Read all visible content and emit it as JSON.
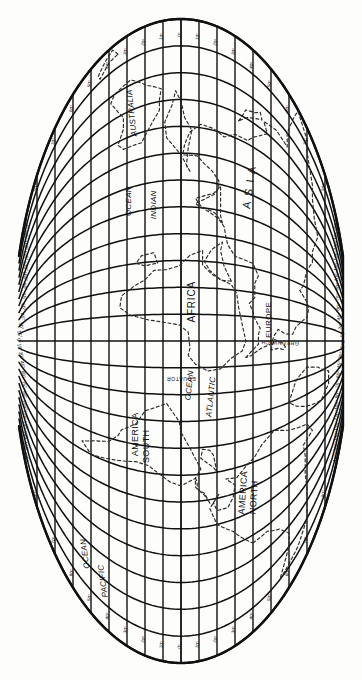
{
  "document": {
    "title": "World Map — Oval (Mollweide-type) Projection, rotated 90°",
    "orientation": "rotated-90-clockwise",
    "line_color": "#101010",
    "coast_color": "#2a2a2a",
    "background": "#fdfdfc"
  },
  "map": {
    "projection": "oval / elliptical (Mollweide-like)",
    "graticule": {
      "meridian_interval_deg": 15,
      "parallel_interval_deg": 10,
      "meridian_count": 17,
      "parallel_count": 17,
      "central_meridian_label": "GREENWICH",
      "equator_label": "EQUATOR"
    },
    "labels": [
      {
        "name": "asia-label",
        "text": "A S I A",
        "region": "continent"
      },
      {
        "name": "europe-label",
        "text": "EUROPE",
        "region": "continent"
      },
      {
        "name": "africa-label",
        "text": "AFRICA",
        "region": "continent"
      },
      {
        "name": "australia-label",
        "text": "AUSTRALIA",
        "region": "continent"
      },
      {
        "name": "north-america-label-1",
        "text": "NORTH",
        "region": "continent"
      },
      {
        "name": "north-america-label-2",
        "text": "AMERICA",
        "region": "continent"
      },
      {
        "name": "south-america-label-1",
        "text": "SOUTH",
        "region": "continent"
      },
      {
        "name": "south-america-label-2",
        "text": "AMERICA",
        "region": "continent"
      },
      {
        "name": "indian-ocean-label-1",
        "text": "INDIAN",
        "region": "ocean"
      },
      {
        "name": "indian-ocean-label-2",
        "text": "OCEAN",
        "region": "ocean"
      },
      {
        "name": "atlantic-ocean-label-1",
        "text": "ATLANTIC",
        "region": "ocean"
      },
      {
        "name": "atlantic-ocean-label-2",
        "text": "OCEAN",
        "region": "ocean"
      },
      {
        "name": "pacific-ocean-label-1",
        "text": "PACIFIC",
        "region": "ocean"
      },
      {
        "name": "pacific-ocean-label-2",
        "text": "OCEAN",
        "region": "ocean"
      },
      {
        "name": "greenwich-label",
        "text": "GREENWICH",
        "region": "meridian"
      },
      {
        "name": "equator-label",
        "text": "EQUATOR",
        "region": "parallel"
      }
    ],
    "degree_ticks": {
      "longitude_top": [
        "15°",
        "30°",
        "45°",
        "60°",
        "75°",
        "90°",
        "105°",
        "120°"
      ],
      "longitude_bottom": [
        "15°",
        "30°",
        "45°",
        "60°",
        "75°",
        "90°",
        "105°",
        "120°"
      ],
      "latitude_left": [
        "10°",
        "20°",
        "30°",
        "40°",
        "50°",
        "60°",
        "70°",
        "80°"
      ],
      "latitude_right": [
        "10°",
        "20°",
        "30°",
        "40°",
        "50°",
        "60°",
        "70°",
        "80°"
      ]
    }
  }
}
